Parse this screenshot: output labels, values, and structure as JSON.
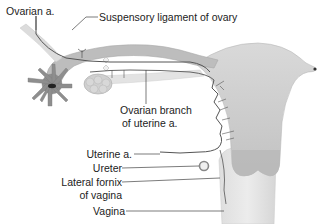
{
  "diagram": {
    "labels": {
      "ovarian_artery": "Ovarian a.",
      "suspensory_ligament": "Suspensory ligament of ovary",
      "ovarian_branch_line1": "Ovarian branch",
      "ovarian_branch_line2": "of uterine a.",
      "uterine_artery": "Uterine a.",
      "ureter": "Ureter",
      "lateral_fornix_line1": "Lateral fornix",
      "lateral_fornix_line2": "of vagina",
      "vagina": "Vagina"
    },
    "colors": {
      "organ_fill": "#c9c9c9",
      "organ_dark": "#9a9a9a",
      "vessel": "#555555",
      "leader_line": "#444444",
      "fimbriae": "#8a8a8a",
      "ovary": "#d8d8d8"
    },
    "structures": [
      "uterus",
      "uterine tube",
      "fimbriae",
      "ovary",
      "cervix",
      "vagina",
      "ureter",
      "ovarian artery",
      "uterine artery"
    ]
  }
}
